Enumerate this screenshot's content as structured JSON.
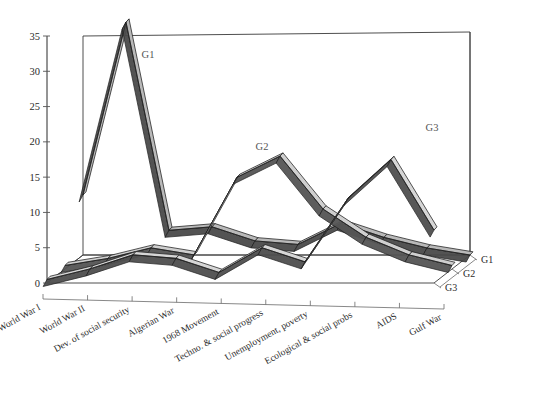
{
  "chart_data": {
    "type": "line",
    "title": "",
    "subtitle": "",
    "xlabel": "",
    "ylabel": "",
    "projection": "3d-ribbon",
    "grid": false,
    "legend_position": "in-plot-annotations",
    "ylim": [
      0,
      35
    ],
    "yticks": [
      0,
      5,
      10,
      15,
      20,
      25,
      30,
      35
    ],
    "ytick_labels": [
      "0",
      "5",
      "10",
      "15",
      "20",
      "25",
      "30",
      "35"
    ],
    "categories": [
      "World War I",
      "World War II",
      "Dev. of social security",
      "Algerian War",
      "1968 Movement",
      "Techno. & social progress",
      "Unemployment, poverty",
      "Ecological & social probs",
      "AIDS",
      "Gulf War"
    ],
    "depth_categories": [
      "G1",
      "G2",
      "G3"
    ],
    "annotations": [
      {
        "text": "G1",
        "x_px": 148,
        "y_px": 58
      },
      {
        "text": "G2",
        "x_px": 262,
        "y_px": 150
      },
      {
        "text": "G3",
        "x_px": 432,
        "y_px": 131
      }
    ],
    "series": [
      {
        "name": "G1",
        "depth_index": 0,
        "face_color": "#4a4a4a",
        "top_color": "#b9b9b9",
        "values": [
          8.5,
          33.0,
          3.5,
          4.0,
          2.0,
          1.5,
          4.5,
          2.5,
          1.0,
          0.0
        ]
      },
      {
        "name": "G2",
        "depth_index": 1,
        "face_color": "#555555",
        "top_color": "#cfcfcf",
        "values": [
          0.5,
          1.5,
          3.0,
          2.0,
          13.0,
          16.0,
          8.5,
          4.5,
          2.0,
          0.5
        ]
      },
      {
        "name": "G3",
        "depth_index": 2,
        "face_color": "#4f4f4f",
        "top_color": "#d6d6d6",
        "values": [
          0.5,
          2.0,
          4.0,
          3.5,
          1.5,
          5.0,
          3.0,
          12.0,
          17.5,
          7.5
        ]
      }
    ],
    "colors": {
      "background": "#ffffff",
      "axis": "#2b2b2b",
      "text": "#2b2b2b",
      "ribbon_dark": "#4a4a4a",
      "ribbon_light": "#cfcfcf"
    },
    "geometry": {
      "origin_x": 47,
      "origin_y": 283,
      "y_top_px": 36,
      "x_step_px": 43,
      "depth_dx_px": 18,
      "depth_dy_px": 14,
      "ribbon_thickness_px": 7
    }
  }
}
